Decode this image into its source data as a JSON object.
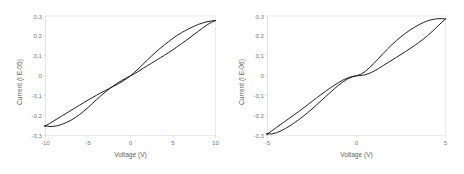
{
  "figure": {
    "background_color": "#ffffff",
    "curve_color": "#151515",
    "axis_color": "#d9d9d9",
    "text_color": "#7b7b7b"
  },
  "chart_data": [
    {
      "type": "line",
      "title": "",
      "subtitle": "",
      "xlabel": "Voltage (V)",
      "ylabel": "Current (I E-05)",
      "xlim": [
        -10,
        10
      ],
      "ylim": [
        -0.3,
        0.3
      ],
      "xticks": [
        -10,
        -5,
        0,
        5,
        10
      ],
      "xticklabels": [
        "-10",
        "-5",
        "0",
        "5",
        "10"
      ],
      "yticks": [
        0.3,
        0.2,
        0.1,
        0,
        -0.1,
        -0.2,
        -0.3
      ],
      "yticklabels": [
        "0.3",
        "0.2",
        "0.1",
        "0",
        "-0.1",
        "-0.2",
        "-0.3"
      ],
      "grid": false,
      "legend": null,
      "annotations": [],
      "series": [
        {
          "name": "forward-sweep",
          "x": [
            -10,
            -9.5,
            -9,
            -8.5,
            -8,
            -7.5,
            -7,
            -6.5,
            -6,
            -5.5,
            -5,
            -4.5,
            -4,
            -3.5,
            -3,
            -2.5,
            -2,
            -1.5,
            -1,
            -0.5,
            0,
            0.5,
            1,
            1.5,
            2,
            2.5,
            3,
            3.5,
            4,
            4.5,
            5,
            5.5,
            6,
            6.5,
            7,
            7.5,
            8,
            8.5,
            9,
            9.5,
            10
          ],
          "y": [
            -0.252,
            -0.239,
            -0.226,
            -0.213,
            -0.2,
            -0.187,
            -0.174,
            -0.161,
            -0.148,
            -0.135,
            -0.122,
            -0.11,
            -0.098,
            -0.086,
            -0.075,
            -0.064,
            -0.053,
            -0.042,
            -0.03,
            -0.016,
            0.0,
            0.018,
            0.038,
            0.059,
            0.08,
            0.1,
            0.12,
            0.138,
            0.155,
            0.172,
            0.188,
            0.203,
            0.216,
            0.228,
            0.239,
            0.249,
            0.258,
            0.265,
            0.271,
            0.275,
            0.277
          ]
        },
        {
          "name": "reverse-sweep",
          "x": [
            10,
            9.5,
            9,
            8.5,
            8,
            7.5,
            7,
            6.5,
            6,
            5.5,
            5,
            4.5,
            4,
            3.5,
            3,
            2.5,
            2,
            1.5,
            1,
            0.5,
            0,
            -0.5,
            -1,
            -1.5,
            -2,
            -2.5,
            -3,
            -3.5,
            -4,
            -4.5,
            -5,
            -5.5,
            -6,
            -6.5,
            -7,
            -7.5,
            -8,
            -8.5,
            -9,
            -9.5,
            -10
          ],
          "y": [
            0.277,
            0.268,
            0.255,
            0.24,
            0.224,
            0.208,
            0.192,
            0.176,
            0.161,
            0.146,
            0.131,
            0.117,
            0.103,
            0.09,
            0.077,
            0.064,
            0.051,
            0.038,
            0.024,
            0.011,
            0.0,
            -0.011,
            -0.023,
            -0.036,
            -0.05,
            -0.066,
            -0.083,
            -0.101,
            -0.12,
            -0.14,
            -0.16,
            -0.178,
            -0.195,
            -0.21,
            -0.223,
            -0.234,
            -0.243,
            -0.25,
            -0.254,
            -0.255,
            -0.252
          ]
        }
      ]
    },
    {
      "type": "line",
      "title": "",
      "subtitle": "",
      "xlabel": "Voltage (V)",
      "ylabel": "Current (I E-06)",
      "xlim": [
        -5,
        5
      ],
      "ylim": [
        -0.3,
        0.3
      ],
      "xticks": [
        -5,
        0,
        5
      ],
      "xticklabels": [
        "-5",
        "0",
        "5"
      ],
      "yticks": [
        0.3,
        0.2,
        0.1,
        0,
        -0.1,
        -0.2,
        -0.3
      ],
      "yticklabels": [
        "0.3",
        "0.2",
        "0.1",
        "0",
        "-0.1",
        "-0.2",
        "-0.3"
      ],
      "grid": false,
      "legend": null,
      "annotations": [],
      "series": [
        {
          "name": "forward-sweep",
          "x": [
            -5,
            -4.75,
            -4.5,
            -4.25,
            -4,
            -3.75,
            -3.5,
            -3.25,
            -3,
            -2.75,
            -2.5,
            -2.25,
            -2,
            -1.75,
            -1.5,
            -1.25,
            -1,
            -0.75,
            -0.5,
            -0.25,
            0,
            0.25,
            0.5,
            0.75,
            1,
            1.25,
            1.5,
            1.75,
            2,
            2.25,
            2.5,
            2.75,
            3,
            3.25,
            3.5,
            3.75,
            4,
            4.25,
            4.5,
            4.75,
            5
          ],
          "y": [
            -0.292,
            -0.276,
            -0.26,
            -0.244,
            -0.228,
            -0.212,
            -0.196,
            -0.18,
            -0.163,
            -0.146,
            -0.129,
            -0.112,
            -0.095,
            -0.079,
            -0.063,
            -0.048,
            -0.034,
            -0.021,
            -0.011,
            -0.004,
            0.0,
            0.008,
            0.022,
            0.042,
            0.064,
            0.088,
            0.112,
            0.135,
            0.157,
            0.177,
            0.196,
            0.213,
            0.229,
            0.243,
            0.256,
            0.267,
            0.276,
            0.282,
            0.286,
            0.287,
            0.285
          ]
        },
        {
          "name": "reverse-sweep",
          "x": [
            5,
            4.75,
            4.5,
            4.25,
            4,
            3.75,
            3.5,
            3.25,
            3,
            2.75,
            2.5,
            2.25,
            2,
            1.75,
            1.5,
            1.25,
            1,
            0.75,
            0.5,
            0.25,
            0,
            -0.25,
            -0.5,
            -0.75,
            -1,
            -1.25,
            -1.5,
            -1.75,
            -2,
            -2.25,
            -2.5,
            -2.75,
            -3,
            -3.25,
            -3.5,
            -3.75,
            -4,
            -4.25,
            -4.5,
            -4.75,
            -5
          ],
          "y": [
            0.285,
            0.265,
            0.243,
            0.222,
            0.202,
            0.184,
            0.167,
            0.151,
            0.136,
            0.121,
            0.107,
            0.093,
            0.079,
            0.065,
            0.051,
            0.037,
            0.024,
            0.013,
            0.005,
            0.001,
            0.0,
            -0.006,
            -0.016,
            -0.03,
            -0.047,
            -0.066,
            -0.086,
            -0.106,
            -0.127,
            -0.147,
            -0.167,
            -0.186,
            -0.204,
            -0.221,
            -0.237,
            -0.252,
            -0.265,
            -0.277,
            -0.286,
            -0.292,
            -0.292
          ]
        }
      ]
    }
  ],
  "panels": [
    {
      "id": "left-panel",
      "ylabel": "Current (I E-05)",
      "xlabel": "Voltage (V)",
      "xticklabels": [
        "-10",
        "-5",
        "0",
        "5",
        "10"
      ],
      "yticklabels": [
        "0.3",
        "0.2",
        "0.1",
        "0",
        "-0.1",
        "-0.2",
        "-0.3"
      ]
    },
    {
      "id": "right-panel",
      "ylabel": "Current (I E-06)",
      "xlabel": "Voltage (V)",
      "xticklabels": [
        "-5",
        "0",
        "5"
      ],
      "yticklabels": [
        "0.3",
        "0.2",
        "0.1",
        "0",
        "-0.1",
        "-0.2",
        "-0.3"
      ]
    }
  ]
}
